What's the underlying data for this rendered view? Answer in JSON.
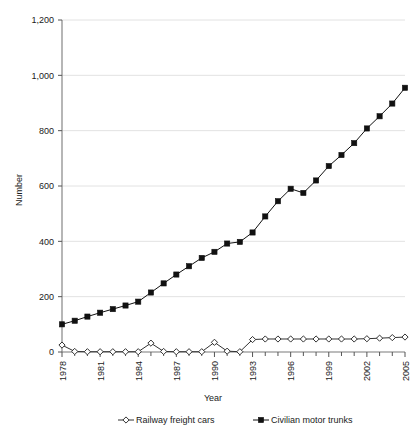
{
  "chart_data": {
    "type": "line",
    "title": "",
    "xlabel": "Year",
    "ylabel": "Number",
    "ylim": [
      0,
      1200
    ],
    "yticks": [
      0,
      200,
      400,
      600,
      800,
      1000,
      1200
    ],
    "ytick_labels": [
      "0",
      "200",
      "400",
      "600",
      "800",
      "1,000",
      "1,200"
    ],
    "x": [
      1978,
      1979,
      1980,
      1981,
      1982,
      1983,
      1984,
      1985,
      1986,
      1987,
      1988,
      1989,
      1990,
      1991,
      1992,
      1993,
      1994,
      1995,
      1996,
      1997,
      1998,
      1999,
      2000,
      2001,
      2002,
      2003,
      2004,
      2005
    ],
    "xtick_labels": [
      "1978",
      "",
      "",
      "1981",
      "",
      "",
      "1984",
      "",
      "",
      "1987",
      "",
      "",
      "1990",
      "",
      "",
      "1993",
      "",
      "",
      "1996",
      "",
      "",
      "1999",
      "",
      "",
      "2002",
      "",
      "",
      "2005"
    ],
    "xticks_labeled": [
      1978,
      1981,
      1984,
      1987,
      1990,
      1993,
      1996,
      1999,
      2002,
      2005
    ],
    "grid": "horizontal",
    "legend_position": "bottom",
    "series": [
      {
        "name": "Railway freight cars",
        "marker": "diamond",
        "color": "#333333",
        "values": [
          25,
          2,
          1,
          1,
          1,
          1,
          1,
          32,
          2,
          1,
          1,
          1,
          35,
          3,
          1,
          45,
          47,
          47,
          47,
          47,
          47,
          47,
          47,
          47,
          48,
          50,
          52,
          54
        ]
      },
      {
        "name": "Civilian motor trunks",
        "marker": "square",
        "color": "#111111",
        "values": [
          100,
          113,
          128,
          142,
          155,
          168,
          182,
          215,
          248,
          280,
          310,
          340,
          362,
          392,
          398,
          432,
          490,
          545,
          590,
          575,
          620,
          672,
          712,
          755,
          808,
          852,
          898,
          955
        ]
      }
    ]
  },
  "legend": {
    "items": [
      {
        "label": "Railway freight cars",
        "marker": "diamond"
      },
      {
        "label": "Civilian motor trunks",
        "marker": "square"
      }
    ]
  },
  "axes": {
    "x_title": "Year",
    "y_title": "Number"
  }
}
